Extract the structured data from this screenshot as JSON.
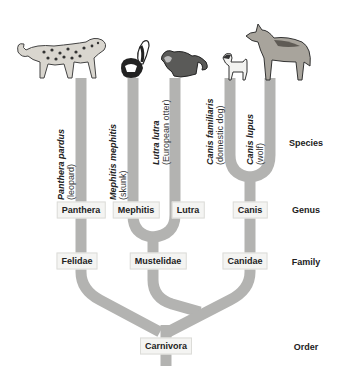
{
  "colors": {
    "branch": "#b3b3b1",
    "box_bg": "#f4f4f2",
    "text": "#222222"
  },
  "ranks": {
    "species": "Species",
    "genus": "Genus",
    "family": "Family",
    "order": "Order"
  },
  "species": [
    {
      "scientific": "Panthera pardus",
      "common": "(leopard)",
      "icon": "leopard-icon"
    },
    {
      "scientific": "Mephitis mephitis",
      "common": "(skunk)",
      "icon": "skunk-icon"
    },
    {
      "scientific": "Lutra lutra",
      "common": "(European otter)",
      "icon": "otter-icon"
    },
    {
      "scientific": "Canis familiaris",
      "common": "(domestic dog)",
      "icon": "dog-icon"
    },
    {
      "scientific": "Canis lupus",
      "common": "(wolf)",
      "icon": "wolf-icon"
    }
  ],
  "genera": [
    "Panthera",
    "Mephitis",
    "Lutra",
    "Canis"
  ],
  "families": [
    "Felidae",
    "Mustelidae",
    "Canidae"
  ],
  "order": "Carnivora"
}
